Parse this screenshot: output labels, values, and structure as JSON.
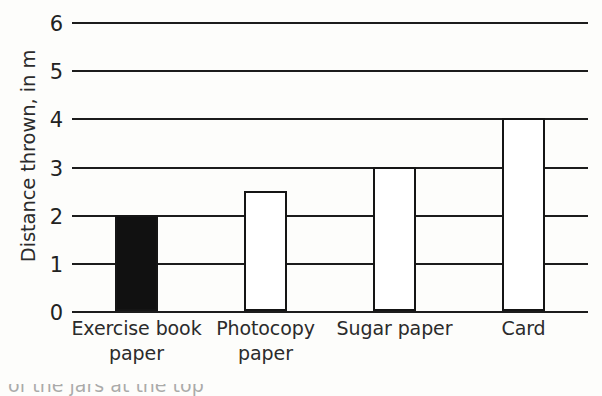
{
  "chart_data": {
    "type": "bar",
    "title": "",
    "xlabel": "",
    "ylabel": "Distance thrown, in m",
    "categories": [
      "Exercise book\npaper",
      "Photocopy\npaper",
      "Sugar paper",
      "Card"
    ],
    "values": [
      2,
      2.5,
      3,
      4
    ],
    "ylim": [
      0,
      6
    ],
    "ytick_labels": [
      "0",
      "1",
      "2",
      "3",
      "4",
      "5",
      "6"
    ],
    "ytick_values": [
      0,
      1,
      2,
      3,
      4,
      5,
      6
    ],
    "grid": "horizontal",
    "legend": "none",
    "bar_fills": [
      "solid-black",
      "white",
      "white",
      "white"
    ],
    "bar_edge_color": "#151515",
    "bar_fill_color": "#111111",
    "background_color": "#fdfdfb",
    "annotations": []
  },
  "figure": {
    "clipped_caption_fragment": "of the jars at the top"
  }
}
